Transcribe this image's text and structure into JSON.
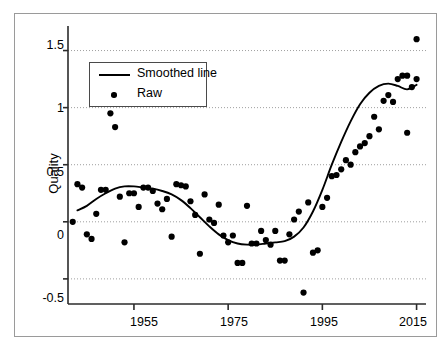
{
  "figure": {
    "background_color": "#ffffff",
    "border_color": "#9a9a9a",
    "foreground_color": "#000000",
    "grid_color": "#9f9f9f"
  },
  "legend": {
    "position": "top-left-inside",
    "items": [
      {
        "label": "Smoothed line",
        "marker": "line"
      },
      {
        "label": "Raw",
        "marker": "dot"
      }
    ]
  },
  "axes": {
    "y_title": "Quality",
    "x_title": "",
    "y_ticks": [
      "1.5",
      "1",
      "0.5",
      "0",
      "-0.5"
    ],
    "x_ticks": [
      "1955",
      "1975",
      "1995",
      "2015"
    ]
  },
  "chart_data": {
    "type": "scatter",
    "title": "",
    "xlabel": "",
    "ylabel": "Quality",
    "xlim": [
      1941,
      2017
    ],
    "ylim": [
      -0.72,
      1.68
    ],
    "yticks": [
      -0.5,
      0,
      0.5,
      1,
      1.5
    ],
    "xticks": [
      1955,
      1975,
      1995,
      2015
    ],
    "grid": "horizontal-dotted",
    "legend_position": "upper left",
    "series": [
      {
        "name": "Raw",
        "type": "scatter",
        "marker": "filled-circle",
        "color": "#000000",
        "x": [
          1942,
          1943,
          1944,
          1945,
          1946,
          1947,
          1948,
          1949,
          1950,
          1951,
          1952,
          1953,
          1954,
          1955,
          1956,
          1957,
          1958,
          1959,
          1960,
          1961,
          1962,
          1963,
          1964,
          1965,
          1966,
          1967,
          1968,
          1969,
          1970,
          1971,
          1972,
          1973,
          1974,
          1975,
          1976,
          1977,
          1978,
          1979,
          1980,
          1981,
          1982,
          1983,
          1984,
          1985,
          1986,
          1987,
          1988,
          1989,
          1990,
          1991,
          1992,
          1993,
          1994,
          1995,
          1996,
          1997,
          1998,
          1999,
          2000,
          2001,
          2002,
          2003,
          2004,
          2005,
          2006,
          2007,
          2008,
          2009,
          2010,
          2011,
          2012,
          2013,
          2014,
          2015
        ],
        "y": [
          0.0,
          0.33,
          0.3,
          -0.11,
          -0.15,
          0.07,
          0.28,
          0.28,
          0.95,
          0.83,
          0.22,
          -0.18,
          0.25,
          0.25,
          0.13,
          0.3,
          0.3,
          0.27,
          0.16,
          0.11,
          0.2,
          -0.13,
          0.33,
          0.32,
          0.31,
          0.18,
          0.06,
          -0.28,
          0.24,
          0.02,
          -0.01,
          0.15,
          -0.12,
          -0.18,
          -0.12,
          -0.36,
          -0.36,
          0.14,
          -0.19,
          -0.19,
          -0.08,
          -0.16,
          -0.2,
          -0.08,
          -0.34,
          -0.34,
          -0.11,
          0.02,
          0.09,
          -0.62,
          0.17,
          -0.27,
          -0.25,
          0.13,
          0.21,
          0.4,
          0.41,
          0.46,
          0.54,
          0.5,
          0.61,
          0.66,
          0.69,
          0.75,
          0.92,
          0.81,
          1.06,
          1.11,
          1.05,
          1.25,
          1.28,
          1.28,
          1.18,
          1.25
        ],
        "note": "approximate readings from pixel positions"
      },
      {
        "name": "Smoothed line",
        "type": "line",
        "color": "#000000",
        "x": [
          1943,
          1945,
          1947,
          1949,
          1951,
          1953,
          1955,
          1957,
          1959,
          1961,
          1963,
          1965,
          1967,
          1969,
          1971,
          1973,
          1975,
          1977,
          1979,
          1981,
          1983,
          1985,
          1987,
          1989,
          1991,
          1993,
          1995,
          1997,
          1999,
          2001,
          2003,
          2005,
          2007,
          2009,
          2011,
          2013,
          2015
        ],
        "y": [
          0.1,
          0.14,
          0.2,
          0.25,
          0.29,
          0.31,
          0.31,
          0.3,
          0.29,
          0.27,
          0.24,
          0.19,
          0.12,
          0.04,
          -0.04,
          -0.11,
          -0.16,
          -0.19,
          -0.2,
          -0.2,
          -0.19,
          -0.18,
          -0.17,
          -0.13,
          -0.05,
          0.09,
          0.28,
          0.5,
          0.7,
          0.88,
          1.03,
          1.13,
          1.19,
          1.21,
          1.19,
          1.16,
          1.2
        ]
      }
    ],
    "outliers_described": [
      {
        "x": 1950,
        "y": 0.95
      },
      {
        "x": 1951,
        "y": 0.83
      },
      {
        "x": 1991,
        "y": -0.62
      },
      {
        "x": 2015,
        "y": 1.6
      },
      {
        "x": 2013,
        "y": 0.78
      }
    ]
  },
  "extra_points": {
    "x": [
      2015,
      2013
    ],
    "y": [
      1.6,
      0.78
    ]
  }
}
